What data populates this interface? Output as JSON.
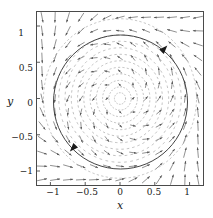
{
  "chart_data": {
    "type": "scatter",
    "title": "",
    "subtitle": "",
    "xlabel": "x",
    "ylabel": "y",
    "xlim": [
      -1.2,
      1.2
    ],
    "ylim": [
      -1.2,
      1.2
    ],
    "grid": false,
    "legend": null,
    "xticks": [
      {
        "value": -1,
        "label": "−1"
      },
      {
        "value": -0.5,
        "label": "−0.5"
      },
      {
        "value": 0,
        "label": "0"
      },
      {
        "value": 0.5,
        "label": "0.5"
      },
      {
        "value": 1,
        "label": "1"
      }
    ],
    "yticks": [
      {
        "value": 1,
        "label": "1"
      },
      {
        "value": 0.5,
        "label": "0.5"
      },
      {
        "value": 0,
        "label": "0"
      },
      {
        "value": -0.5,
        "label": "−0.5"
      },
      {
        "value": -1,
        "label": "−1"
      }
    ],
    "limit_cycle": {
      "center_x": 0,
      "center_y": 0,
      "radius": 1,
      "direction": "counterclockwise",
      "stroke": "#3a3a3a"
    },
    "flow_arrow_markers": [
      {
        "x": 0.68,
        "y": 0.73,
        "angle_deg": -47
      },
      {
        "x": -0.72,
        "y": -0.73,
        "angle_deg": 133
      }
    ],
    "inner_spiral_radii": [
      0.08,
      0.16,
      0.25,
      0.34,
      0.43,
      0.52,
      0.61,
      0.7,
      0.79,
      0.88
    ],
    "outer_spiral_radii": [
      1.1
    ],
    "vector_field": {
      "grid_min": -1.12,
      "grid_max": 1.12,
      "grid_steps": 13,
      "rule": "dx/dt = -y + x(1 - x^2 - y^2), dy/dt = x + y(1 - x^2 - y^2)",
      "color": "#555555"
    },
    "colors": {
      "axes": "#4a4a4a",
      "text": "#1a1a1a",
      "background": "#ffffff",
      "arrows": "#555555",
      "cycle": "#3a3a3a",
      "spirals": "#9a9a9a"
    }
  },
  "axis": {
    "x_title": "x",
    "y_title": "y"
  }
}
